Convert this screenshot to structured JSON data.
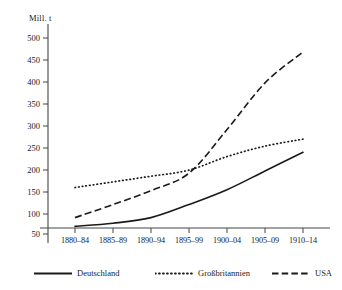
{
  "chart_data": {
    "type": "line",
    "title": "",
    "subtitle": "",
    "xlabel": "",
    "ylabel": "Mill. t",
    "unit_label": "Mill. t",
    "categories": [
      "1880–84",
      "1885–89",
      "1890–94",
      "1895–99",
      "1900–04",
      "1905–09",
      "1910–14"
    ],
    "x": [
      1,
      2,
      3,
      4,
      5,
      6,
      7
    ],
    "ylim": [
      0,
      500
    ],
    "yticks": [
      50,
      100,
      150,
      200,
      250,
      300,
      350,
      400,
      450,
      500
    ],
    "ytick_labels": [
      "50",
      "100",
      "150",
      "200",
      "250",
      "300",
      "350",
      "400",
      "450",
      "500"
    ],
    "grid": false,
    "legend_position": "bottom",
    "series": [
      {
        "name": "Deutschland",
        "style": "solid",
        "color": "#1a1a1a",
        "values": [
          68,
          75,
          88,
          118,
          152,
          195,
          238
        ]
      },
      {
        "name": "Großbritannien",
        "style": "dotted",
        "color": "#1a1a1a",
        "values": [
          157,
          170,
          183,
          197,
          228,
          252,
          268
        ]
      },
      {
        "name": "USA",
        "style": "dashed",
        "color": "#1a1a1a",
        "values": [
          88,
          118,
          150,
          190,
          290,
          397,
          468
        ]
      }
    ]
  },
  "axis": {
    "unit_label": "Mill. t",
    "ytick_labels": [
      "500",
      "450",
      "400",
      "350",
      "300",
      "250",
      "200",
      "150",
      "100",
      "50"
    ],
    "xtick_labels": [
      "1880–84",
      "1885–89",
      "1890–94",
      "1895–99",
      "1900–04",
      "1905–09",
      "1910–14"
    ]
  },
  "legend": {
    "items": [
      {
        "label": "Deutschland",
        "style": "solid"
      },
      {
        "label": "Großbritannien",
        "style": "dotted"
      },
      {
        "label": "USA",
        "style": "dashed"
      }
    ]
  },
  "colors": {
    "ink": "#1a1a1a",
    "axis": "#444444",
    "background": "#ffffff"
  }
}
